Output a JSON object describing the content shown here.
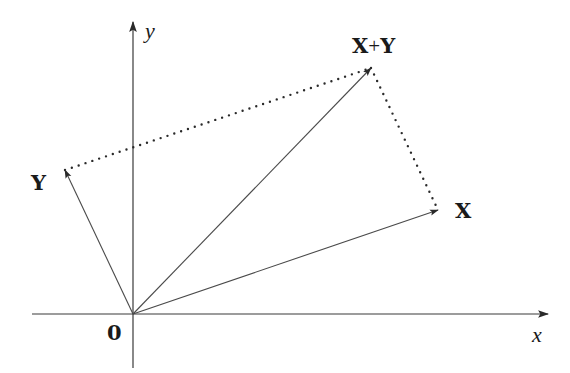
{
  "diagram": {
    "title": "",
    "type": "vector-addition-parallelogram",
    "origin": {
      "label": "0",
      "px": [
        133,
        314
      ]
    },
    "axes": {
      "x": {
        "label": "x",
        "from": [
          32,
          314
        ],
        "to": [
          548,
          314
        ]
      },
      "y": {
        "label": "y",
        "from": [
          133,
          368
        ],
        "to": [
          133,
          22
        ]
      }
    },
    "vectors": [
      {
        "id": "X",
        "label": "X",
        "from": [
          133,
          314
        ],
        "to": [
          438,
          210
        ]
      },
      {
        "id": "Y",
        "label": "Y",
        "from": [
          133,
          314
        ],
        "to": [
          65,
          170
        ]
      },
      {
        "id": "XplusY",
        "label_left": "X",
        "label_plus": "+",
        "label_right": "Y",
        "from": [
          133,
          314
        ],
        "to": [
          371,
          68
        ]
      }
    ],
    "dotted_edges": [
      {
        "from": [
          65,
          170
        ],
        "to": [
          371,
          68
        ]
      },
      {
        "from": [
          371,
          68
        ],
        "to": [
          438,
          210
        ]
      }
    ],
    "colors": {
      "line": "#4a4a4a",
      "axis": "#3a3a3a",
      "text": "#1a1a1a",
      "background": "#ffffff"
    }
  }
}
